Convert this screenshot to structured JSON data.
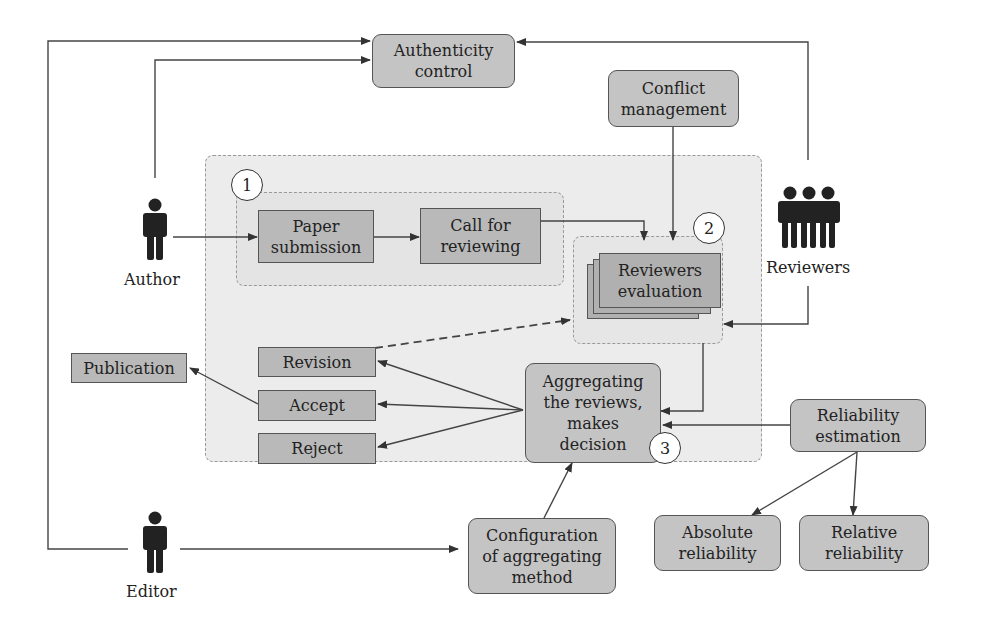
{
  "diagram": {
    "actors": {
      "author": "Author",
      "reviewers": "Reviewers",
      "editor": "Editor"
    },
    "nodes": {
      "authenticity_control": "Authenticity\ncontrol",
      "conflict_management": "Conflict\nmanagement",
      "paper_submission": "Paper\nsubmission",
      "call_for_reviewing": "Call for\nreviewing",
      "reviewers_evaluation": "Reviewers\nevaluation",
      "aggregating": "Aggregating\nthe reviews,\nmakes\ndecision",
      "revision": "Revision",
      "accept": "Accept",
      "reject": "Reject",
      "publication": "Publication",
      "reliability_estimation": "Reliability\nestimation",
      "configuration": "Configuration\nof aggregating\nmethod",
      "absolute_reliability": "Absolute\nreliability",
      "relative_reliability": "Relative\nreliability"
    },
    "step_numbers": {
      "step1": "1",
      "step2": "2",
      "step3": "3"
    },
    "edges": [
      {
        "from": "Editor",
        "to": "Authenticity control"
      },
      {
        "from": "Author",
        "to": "Authenticity control"
      },
      {
        "from": "Reviewers",
        "to": "Authenticity control"
      },
      {
        "from": "Author",
        "to": "Paper submission"
      },
      {
        "from": "Paper submission",
        "to": "Call for reviewing"
      },
      {
        "from": "Call for reviewing",
        "to": "Reviewers evaluation"
      },
      {
        "from": "Conflict management",
        "to": "Reviewers evaluation"
      },
      {
        "from": "Reviewers",
        "to": "Reviewers evaluation"
      },
      {
        "from": "Reviewers evaluation",
        "to": "Aggregating the reviews, makes decision"
      },
      {
        "from": "Aggregating the reviews, makes decision",
        "to": "Revision"
      },
      {
        "from": "Aggregating the reviews, makes decision",
        "to": "Accept"
      },
      {
        "from": "Aggregating the reviews, makes decision",
        "to": "Reject"
      },
      {
        "from": "Revision",
        "to": "Reviewers evaluation",
        "style": "dashed"
      },
      {
        "from": "Accept",
        "to": "Publication"
      },
      {
        "from": "Reliability estimation",
        "to": "Aggregating the reviews, makes decision"
      },
      {
        "from": "Reliability estimation",
        "to": "Absolute reliability"
      },
      {
        "from": "Reliability estimation",
        "to": "Relative reliability"
      },
      {
        "from": "Configuration of aggregating method",
        "to": "Aggregating the reviews, makes decision"
      },
      {
        "from": "Editor",
        "to": "Configuration of aggregating method"
      }
    ],
    "colors": {
      "box_fill": "#b9b9b9",
      "round_box_fill": "#c4c4c4",
      "region_fill": "#ececec",
      "line": "#444444"
    }
  }
}
